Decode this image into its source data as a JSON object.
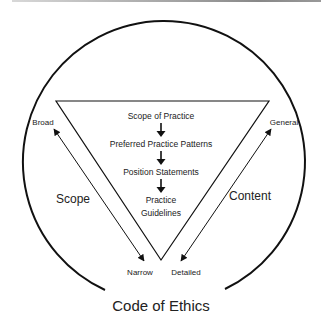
{
  "diagram": {
    "title": "Code of Ethics",
    "hierarchy": [
      "Scope of Practice",
      "Preferred Practice Patterns",
      "Position Statements",
      "Practice",
      "Guidelines"
    ],
    "left_axis": {
      "label": "Scope",
      "top": "Broad",
      "bottom": "Narrow"
    },
    "right_axis": {
      "label": "Content",
      "top": "General",
      "bottom": "Detailed"
    },
    "colors": {
      "stroke": "#111111",
      "text": "#222222",
      "background": "#ffffff"
    }
  }
}
